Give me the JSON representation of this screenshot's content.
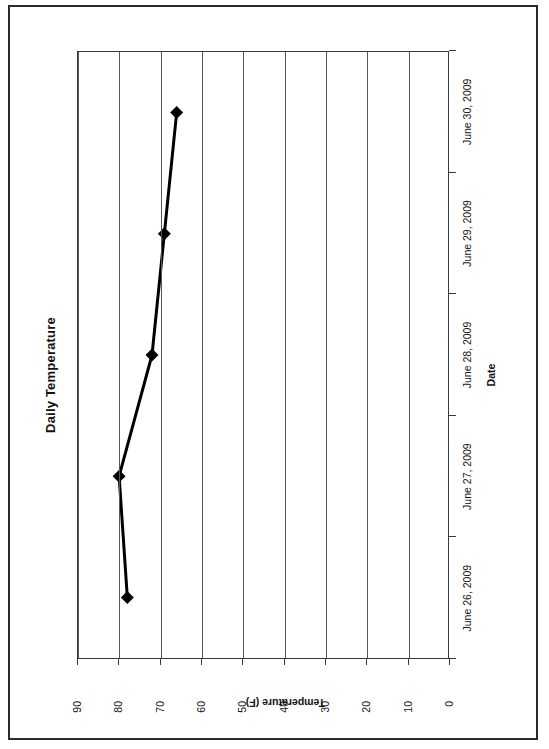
{
  "chart_data": {
    "type": "line",
    "title": "Daily Temperature",
    "xlabel": "Date",
    "ylabel": "Temperature (F)",
    "categories": [
      "June 26, 2009",
      "June 27, 2009",
      "June 28, 2009",
      "June 29, 2009",
      "June 30, 2009"
    ],
    "values": [
      78,
      80,
      72,
      69,
      66
    ],
    "series": [
      {
        "name": "Temperature",
        "values": [
          78,
          80,
          72,
          69,
          66
        ],
        "marker": "diamond",
        "color": "#000000"
      }
    ],
    "ylim": [
      0,
      90
    ],
    "ytick_labels": [
      "0",
      "10",
      "20",
      "30",
      "40",
      "50",
      "60",
      "70",
      "80",
      "90"
    ],
    "ytick_values": [
      0,
      10,
      20,
      30,
      40,
      50,
      60,
      70,
      80,
      90
    ],
    "grid": "horizontal",
    "legend": "none",
    "orientation": "page-rotated-90-ccw"
  },
  "page": {
    "has_scan_border": true,
    "background": "#ffffff",
    "line_color": "#000000",
    "axis_color": "#3a3a3a",
    "grid_color": "#555555"
  }
}
